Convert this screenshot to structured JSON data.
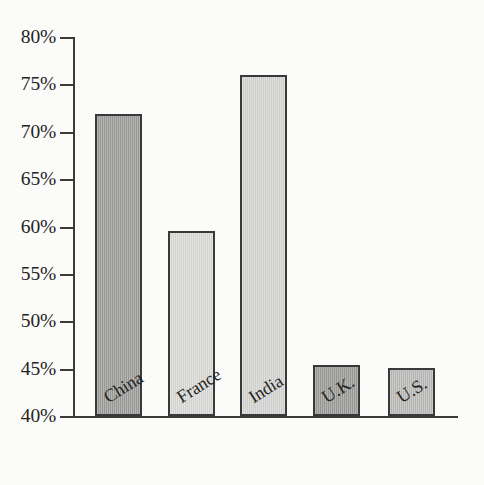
{
  "top_bleed_text": "",
  "chart_data": {
    "type": "bar",
    "title": "",
    "subtitle": "",
    "xlabel": "",
    "ylabel": "",
    "categories": [
      "China",
      "France",
      "India",
      "U.K.",
      "U.S."
    ],
    "values": [
      71.9,
      59.5,
      76.0,
      45.4,
      45.1
    ],
    "value_unit": "%",
    "ylim": [
      40,
      80
    ],
    "ytick_values": [
      80,
      75,
      70,
      65,
      60,
      55,
      50,
      45,
      40
    ],
    "ytick_labels": [
      "80%",
      "75%",
      "70%",
      "65%",
      "60%",
      "55%",
      "50%",
      "45%",
      "40%"
    ],
    "grid": false,
    "legend": "none",
    "bar_colors": [
      "#9b9b99",
      "#d9d9d7",
      "#d4d4d2",
      "#9a9a98",
      "#b9b9b7"
    ],
    "bar_outline_color": "#39393a",
    "axis_color": "#3a3a38",
    "background_color": "#fbfbfa",
    "text_color": "#242422",
    "xlabel_rotation_deg": -32
  }
}
